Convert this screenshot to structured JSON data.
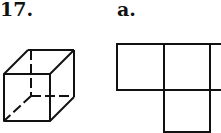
{
  "problem": {
    "number": "17.",
    "figure": "cube-with-hidden-edges-dashed",
    "option_label": "a.",
    "option_figure": "net-of-four-squares"
  },
  "colors": {
    "line": "#111111",
    "background": "#ffffff"
  },
  "cube": {
    "front_face": {
      "x": 4,
      "y": 74,
      "w": 46,
      "h": 47
    },
    "back_face": {
      "x": 27,
      "y": 50,
      "w": 47,
      "h": 46
    }
  },
  "net": {
    "squares": [
      {
        "x": 117,
        "y": 44,
        "w": 47,
        "h": 46
      },
      {
        "x": 164,
        "y": 44,
        "w": 46,
        "h": 46
      },
      {
        "x": 210,
        "y": 44,
        "w": 20,
        "h": 46
      },
      {
        "x": 164,
        "y": 90,
        "w": 46,
        "h": 42
      }
    ]
  }
}
